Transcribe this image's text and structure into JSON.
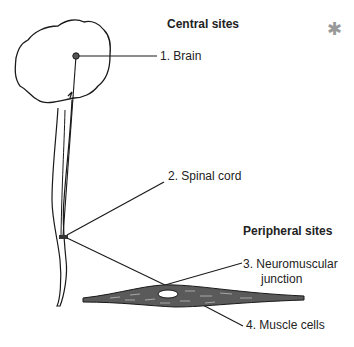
{
  "diagram": {
    "headings": {
      "central": "Central sites",
      "peripheral": "Peripheral sites"
    },
    "labels": [
      {
        "id": "brain",
        "text": "1. Brain"
      },
      {
        "id": "spinal-cord",
        "text": "2. Spinal cord"
      },
      {
        "id": "nmj-line1",
        "text": "3.  Neuromuscular"
      },
      {
        "id": "nmj-line2",
        "text": "junction"
      },
      {
        "id": "muscle",
        "text": "4. Muscle cells"
      }
    ],
    "mark": "✱",
    "colors": {
      "line": "#1a1a1a",
      "muscle_fill": "#555555",
      "mark": "#999999"
    }
  }
}
